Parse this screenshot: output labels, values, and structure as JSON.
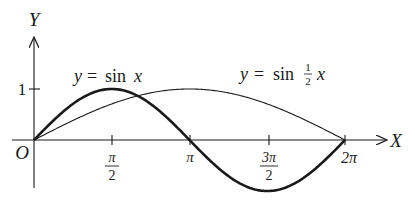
{
  "figure": {
    "axis_x_label": "X",
    "axis_y_label": "Y",
    "origin_label": "O",
    "y_tick_label": "1",
    "x_ticks": [
      {
        "num": "π",
        "den": "2",
        "value": 1.5708
      },
      {
        "label": "π",
        "value": 3.1416
      },
      {
        "num": "3π",
        "den": "2",
        "value": 4.7124
      },
      {
        "label": "2π",
        "value": 6.2832
      }
    ],
    "curve_labels": {
      "sin_x": {
        "y": "y",
        "eq": "=",
        "fn": "sin",
        "var": "x"
      },
      "sin_half_x": {
        "y": "y",
        "eq": "=",
        "fn": "sin",
        "frac_num": "1",
        "frac_den": "2",
        "var": "x"
      }
    },
    "colors": {
      "ink": "#1a1a1a",
      "background": "#ffffff"
    }
  },
  "chart_data": {
    "type": "line",
    "title": "",
    "xlabel": "X",
    "ylabel": "Y",
    "xlim": [
      0,
      6.2832
    ],
    "ylim": [
      -1,
      1
    ],
    "x_tick_labels": [
      "π/2",
      "π",
      "3π/2",
      "2π"
    ],
    "y_tick_labels": [
      "1"
    ],
    "series": [
      {
        "name": "y = sin x",
        "stroke": "thick",
        "x": [
          0,
          1.5708,
          3.1416,
          4.7124,
          6.2832
        ],
        "values": [
          0,
          1,
          0,
          -1,
          0
        ]
      },
      {
        "name": "y = sin ½x",
        "stroke": "thin",
        "x": [
          0,
          1.5708,
          3.1416,
          4.7124,
          6.2832
        ],
        "values": [
          0,
          0.7071,
          1,
          0.7071,
          0
        ]
      }
    ]
  }
}
